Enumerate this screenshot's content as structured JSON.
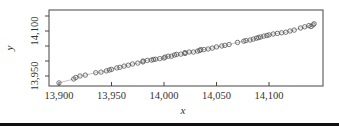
{
  "chart_data": {
    "type": "scatter",
    "title": "",
    "xlabel": "x",
    "ylabel": "y",
    "xlim": [
      13890,
      14148
    ],
    "ylim": [
      13917,
      14168
    ],
    "xticks": [
      13900,
      13950,
      14000,
      14050,
      14100
    ],
    "xtick_labels": [
      "13,900",
      "13,950",
      "14,000",
      "14,050",
      "14,100"
    ],
    "yticks": [
      13950,
      14000,
      14050,
      14100,
      14150
    ],
    "ytick_labels": [
      "13,950",
      "",
      "",
      "14,100",
      ""
    ],
    "grid": false,
    "legend": null,
    "connecting_line": true,
    "marker": "open-circle",
    "series": [
      {
        "name": "observations",
        "x": [
          13900,
          13914,
          13916,
          13920,
          13925,
          13935,
          13940,
          13945,
          13948,
          13950,
          13955,
          13958,
          13962,
          13966,
          13970,
          13975,
          13980,
          13980,
          13984,
          13988,
          13990,
          13992,
          13996,
          14000,
          14001,
          14004,
          14007,
          14010,
          14012,
          14016,
          14020,
          14020,
          14024,
          14028,
          14032,
          14034,
          14035,
          14038,
          14042,
          14046,
          14050,
          14055,
          14058,
          14062,
          14070,
          14076,
          14078,
          14082,
          14085,
          14088,
          14090,
          14092,
          14095,
          14098,
          14100,
          14104,
          14108,
          14112,
          14116,
          14120,
          14124,
          14130,
          14134,
          14138,
          14140,
          14142,
          14143
        ],
        "y": [
          13927,
          13940,
          13945,
          13950,
          13953,
          13961,
          13963,
          13967,
          13970,
          13972,
          13977,
          13979,
          13983,
          13986,
          13990,
          13993,
          13997,
          14000,
          14002,
          14003,
          14005,
          14006,
          14008,
          14010,
          14013,
          14016,
          14016,
          14020,
          14022,
          14023,
          14025,
          14028,
          14030,
          14030,
          14033,
          14035,
          14038,
          14038,
          14040,
          14043,
          14047,
          14050,
          14052,
          14055,
          14062,
          14066,
          14068,
          14070,
          14073,
          14076,
          14078,
          14080,
          14083,
          14085,
          14087,
          14090,
          14092,
          14094,
          14096,
          14100,
          14103,
          14110,
          14114,
          14118,
          14115,
          14120,
          14124
        ]
      }
    ]
  },
  "page": {
    "bottom_bar_color": "#111111",
    "marker_color": "#555555",
    "line_color": "#999999",
    "axis_color": "#444444"
  }
}
